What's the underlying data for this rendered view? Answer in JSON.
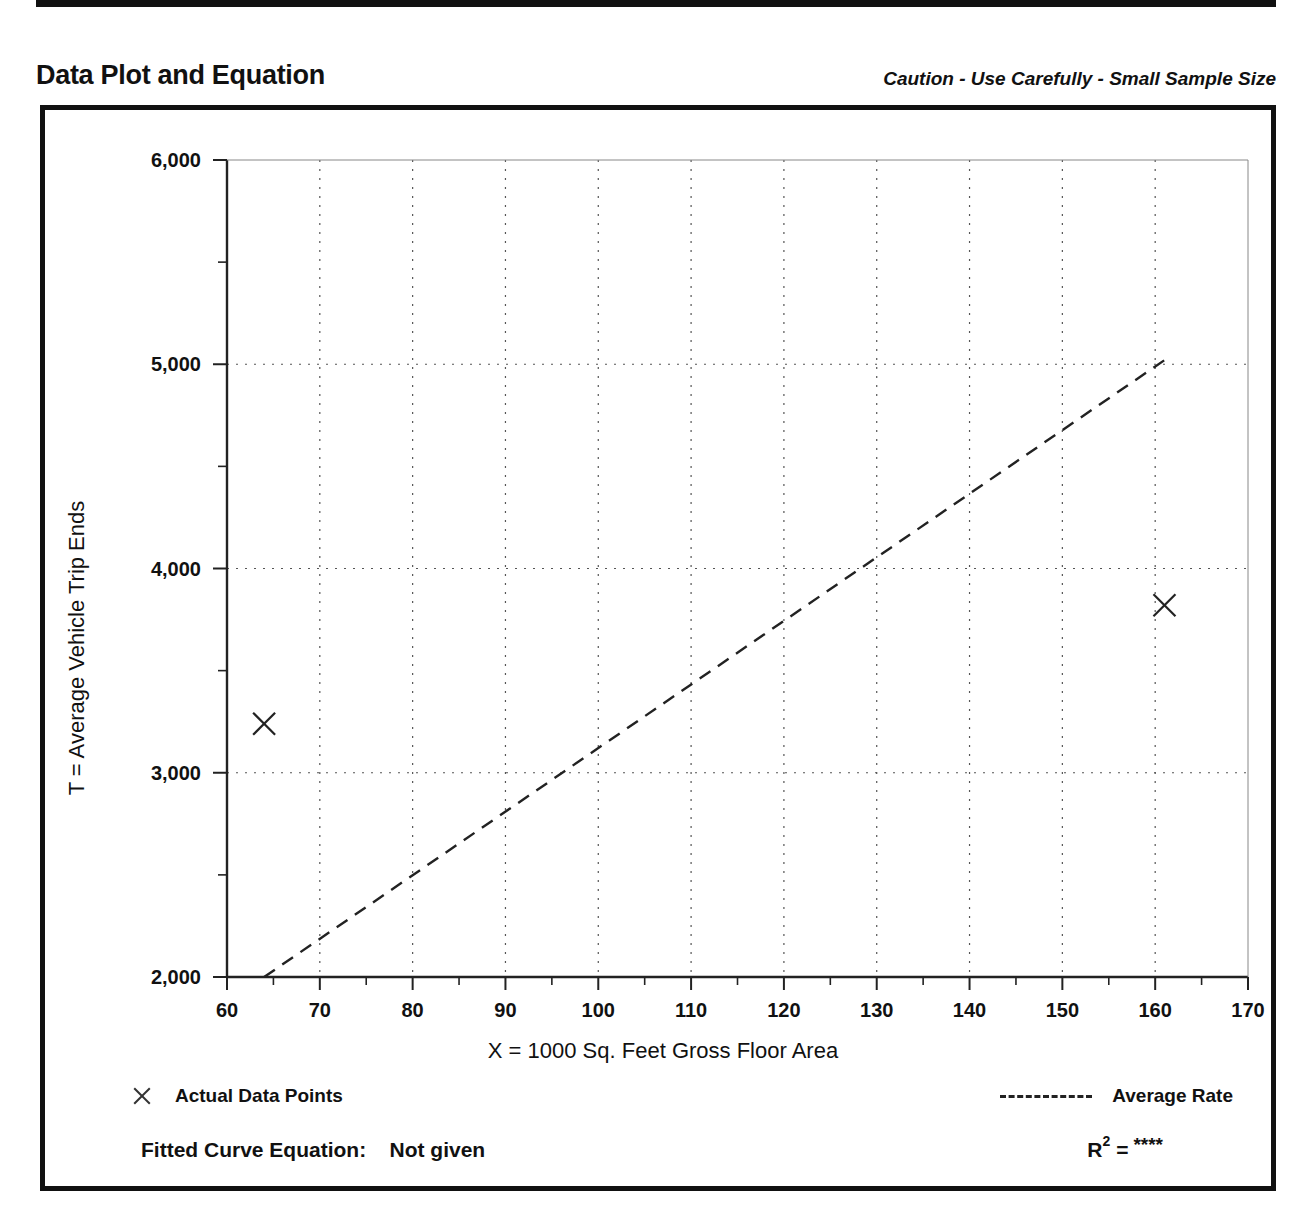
{
  "page": {
    "title": "Data Plot and Equation",
    "caution_note": "Caution - Use Carefully - Small Sample Size"
  },
  "legend": {
    "points_label": "Actual Data Points",
    "line_label": "Average Rate",
    "point_marker_icon": "x-marker-icon",
    "line_marker_icon": "dashed-line-icon"
  },
  "equation": {
    "fitted_curve_label": "Fitted Curve Equation:",
    "fitted_curve_value": "Not given",
    "r_symbol": "R",
    "r_exponent": "2",
    "r_equals": "=",
    "r_value": "****"
  },
  "chart_data": {
    "type": "scatter",
    "title": "Data Plot and Equation",
    "subtitle": "Caution - Use Carefully - Small Sample Size",
    "xlabel": "X = 1000 Sq. Feet Gross Floor Area",
    "ylabel": "T = Average Vehicle Trip Ends",
    "xlim": [
      60,
      170
    ],
    "ylim": [
      2000,
      6000
    ],
    "grid": true,
    "legend_position": "below-axes",
    "xticks": [
      60,
      70,
      80,
      90,
      100,
      110,
      120,
      130,
      140,
      150,
      160,
      170
    ],
    "xtick_labels": [
      "60",
      "70",
      "80",
      "90",
      "100",
      "110",
      "120",
      "130",
      "140",
      "150",
      "160",
      "170"
    ],
    "xminor_step": 5,
    "yticks": [
      2000,
      3000,
      4000,
      5000,
      6000
    ],
    "ytick_labels": [
      "2,000",
      "3,000",
      "4,000",
      "5,000",
      "6,000"
    ],
    "yminor_step": 500,
    "series": [
      {
        "name": "Actual Data Points",
        "type": "scatter",
        "marker": "x",
        "points": [
          {
            "x": 64,
            "y": 3240
          },
          {
            "x": 161,
            "y": 3820
          }
        ]
      },
      {
        "name": "Average Rate",
        "type": "line",
        "style": "dashed",
        "points": [
          {
            "x": 64,
            "y": 2000
          },
          {
            "x": 161,
            "y": 5020
          }
        ]
      }
    ]
  }
}
